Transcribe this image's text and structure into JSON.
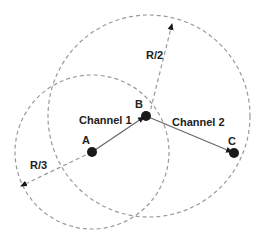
{
  "diagram": {
    "nodes": [
      {
        "id": "A",
        "label": "A",
        "x": 92,
        "y": 152
      },
      {
        "id": "B",
        "label": "B",
        "x": 146,
        "y": 116
      },
      {
        "id": "C",
        "label": "C",
        "x": 234,
        "y": 153
      }
    ],
    "channels": [
      {
        "label": "Channel 1",
        "from": "A",
        "to": "B"
      },
      {
        "label": "Channel 2",
        "from": "B",
        "to": "C"
      }
    ],
    "ranges": [
      {
        "label": "R/3",
        "center": "A",
        "radius": 77
      },
      {
        "label": "R/2",
        "center": "B",
        "radius": 101
      }
    ],
    "colors": {
      "node": "#1a1a1a",
      "link": "#666666",
      "dashed": "#999999"
    }
  }
}
